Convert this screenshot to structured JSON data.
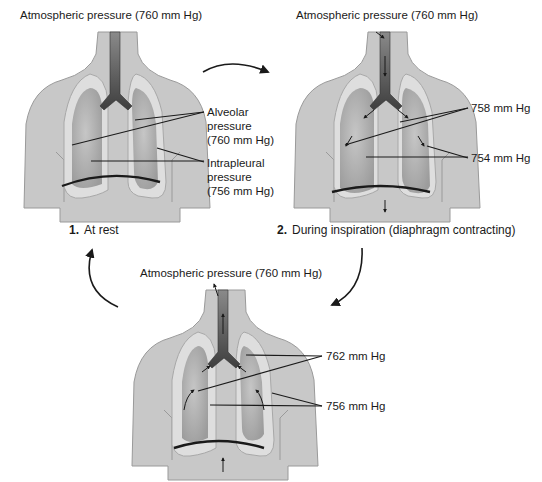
{
  "colors": {
    "torso": "#c8c8c8",
    "torso_outline": "#9a9a9a",
    "pleura": "#dcdcdc",
    "lung": "#a9a9a9",
    "trachea": "#505050",
    "line": "#1a1a1a"
  },
  "panels": [
    {
      "step": "1.",
      "caption": "At rest",
      "atmospheric_label": "Atmospheric pressure (760 mm Hg)",
      "callouts": [
        {
          "label": "Alveolar",
          "line2": "pressure",
          "line3": "(760 mm Hg)"
        },
        {
          "label": "Intrapleural",
          "line2": "pressure",
          "line3": "(756 mm Hg)"
        }
      ]
    },
    {
      "step": "2.",
      "caption": "During inspiration (diaphragm contracting)",
      "atmospheric_label": "Atmospheric pressure (760 mm Hg)",
      "callouts": [
        {
          "label": "758 mm Hg"
        },
        {
          "label": "754 mm Hg"
        }
      ]
    },
    {
      "step": "3.",
      "caption": "",
      "atmospheric_label": "Atmospheric pressure (760 mm Hg)",
      "callouts": [
        {
          "label": "762 mm Hg"
        },
        {
          "label": "756 mm Hg"
        }
      ]
    }
  ]
}
